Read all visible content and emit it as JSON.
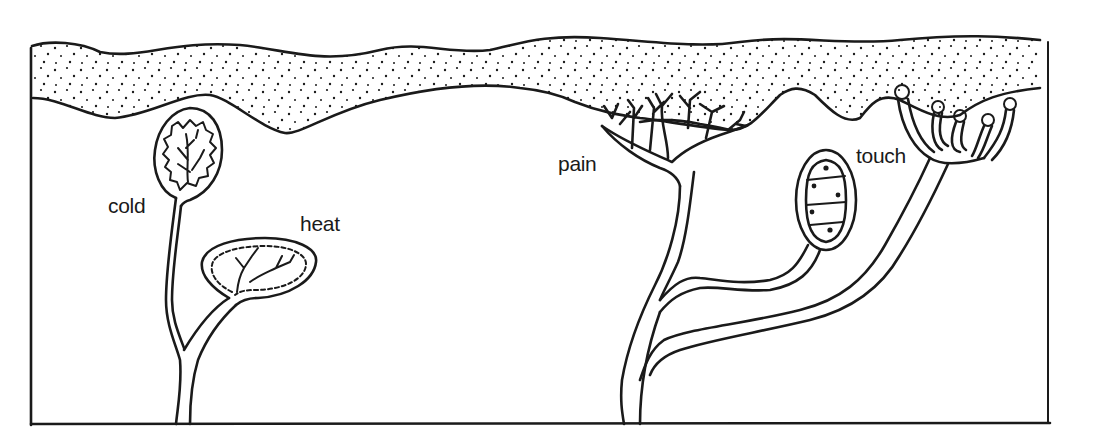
{
  "diagram": {
    "labels": {
      "cold": "cold",
      "heat": "heat",
      "pain": "pain",
      "touch": "touch"
    },
    "colors": {
      "ink": "#1a1a1a",
      "background": "#ffffff"
    }
  }
}
